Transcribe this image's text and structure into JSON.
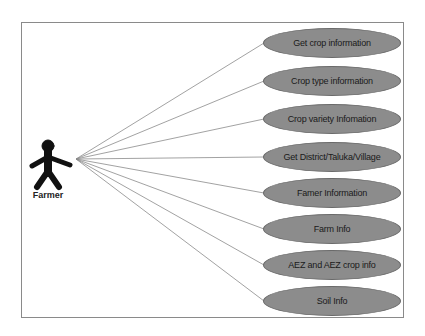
{
  "diagram": {
    "type": "use-case",
    "actor": {
      "label": "Farmer",
      "icon": "stick-figure-icon"
    },
    "use_cases": [
      {
        "label": "Get crop information",
        "cy": 43
      },
      {
        "label": "Crop type information",
        "cy": 81
      },
      {
        "label": "Crop variety Infomation",
        "cy": 119
      },
      {
        "label": "Get District/Taluka/Village",
        "cy": 157
      },
      {
        "label": "Famer Information",
        "cy": 193
      },
      {
        "label": "Farm Info",
        "cy": 229
      },
      {
        "label": "AEZ and AEZ crop info",
        "cy": 265
      },
      {
        "label": "Soil Info",
        "cy": 301
      }
    ],
    "colors": {
      "ellipse_fill": "#8c8c8c",
      "line": "#8a8a8a",
      "actor": "#111111"
    }
  }
}
